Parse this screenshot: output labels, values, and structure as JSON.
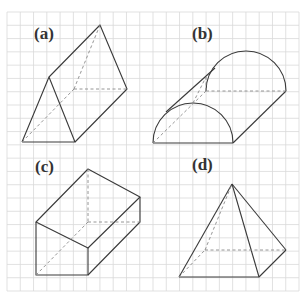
{
  "figure": {
    "grid": {
      "x0": 7,
      "y0": 12,
      "x1": 299,
      "y1": 291,
      "cols": 22,
      "rows": 21,
      "line_color": "#d9d9d9"
    },
    "colors": {
      "solid_edge": "#3a3a3a",
      "hidden_edge": "#8a8a8a",
      "label": "#333333"
    },
    "panels": [
      {
        "label": "(a)",
        "shape": "triangular-prism",
        "label_pos": [
          34,
          39
        ]
      },
      {
        "label": "(b)",
        "shape": "half-cylinder",
        "label_pos": [
          192,
          39
        ]
      },
      {
        "label": "(c)",
        "shape": "cuboid",
        "label_pos": [
          35,
          172
        ]
      },
      {
        "label": "(d)",
        "shape": "square-pyramid",
        "label_pos": [
          192,
          170
        ]
      }
    ]
  }
}
